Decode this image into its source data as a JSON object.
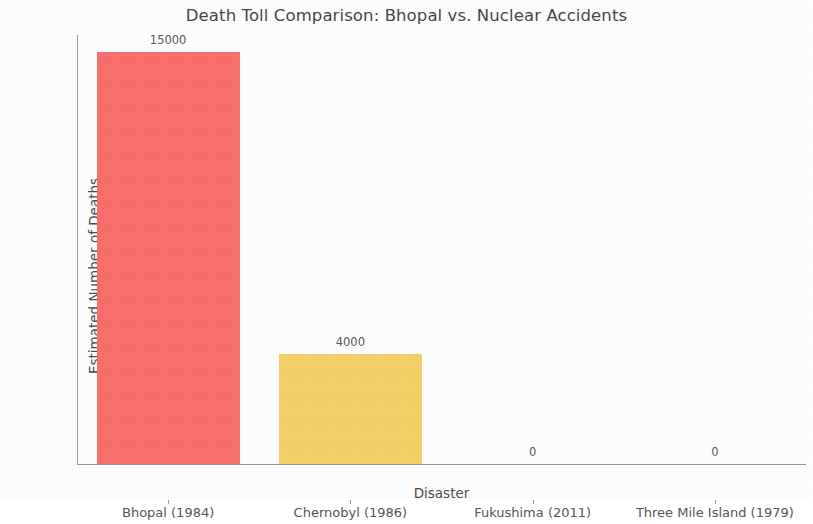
{
  "chart_data": {
    "type": "bar",
    "title": "Death Toll Comparison: Bhopal vs. Nuclear Accidents",
    "xlabel": "Disaster",
    "ylabel": "Estimated Number of Deaths",
    "categories": [
      "Bhopal (1984)",
      "Chernobyl (1986)",
      "Fukushima (2011)",
      "Three Mile Island (1979)"
    ],
    "values": [
      15000,
      4000,
      0,
      0
    ],
    "value_labels": [
      "15000",
      "4000",
      "0",
      "0"
    ],
    "bar_colors": [
      "#fa706e",
      "#f6d169",
      "#fa706e",
      "#f6d169"
    ],
    "ylim": [
      0,
      15600
    ],
    "ytick_values": [
      0,
      2000,
      4000,
      6000,
      8000,
      10000,
      12000,
      14000
    ],
    "ytick_labels": [
      "0",
      "2000",
      "4000",
      "6000",
      "8000",
      "10000",
      "12000",
      "14000"
    ],
    "grid": false,
    "legend": null
  },
  "colors": {
    "background": "#ffffff",
    "axis": "#9a9a9a",
    "text": "#555555",
    "title_text": "#474747",
    "bar_red": "#fa706e",
    "bar_yellow": "#f6d169"
  }
}
